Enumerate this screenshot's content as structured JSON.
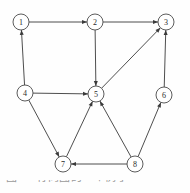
{
  "figure": {
    "caption": "图 一 有向图的一个例子",
    "background_color": "#fefefe",
    "node_fill_color": "#ffffff",
    "node_stroke_color": "#4a4a4a",
    "edge_color": "#3a3a3a",
    "label_color": "#2b2b2b",
    "width": 190,
    "height": 193
  },
  "chart_data": {
    "type": "diagram",
    "graph_type": "directed graph",
    "title": "",
    "node_radius": 8,
    "nodes": [
      {
        "id": "1",
        "label": "1",
        "x": 21,
        "y": 22
      },
      {
        "id": "2",
        "label": "2",
        "x": 95,
        "y": 22
      },
      {
        "id": "3",
        "label": "3",
        "x": 166,
        "y": 22
      },
      {
        "id": "4",
        "label": "4",
        "x": 25,
        "y": 93
      },
      {
        "id": "5",
        "label": "5",
        "x": 96,
        "y": 94
      },
      {
        "id": "6",
        "label": "6",
        "x": 164,
        "y": 95
      },
      {
        "id": "7",
        "label": "7",
        "x": 63,
        "y": 164
      },
      {
        "id": "8",
        "label": "8",
        "x": 135,
        "y": 164
      }
    ],
    "edges": [
      {
        "from": "1",
        "to": "2",
        "directed": true
      },
      {
        "from": "2",
        "to": "3",
        "directed": true
      },
      {
        "from": "4",
        "to": "1",
        "directed": true
      },
      {
        "from": "2",
        "to": "5",
        "directed": true
      },
      {
        "from": "4",
        "to": "5",
        "directed": true
      },
      {
        "from": "5",
        "to": "3",
        "directed": true
      },
      {
        "from": "6",
        "to": "3",
        "directed": true
      },
      {
        "from": "4",
        "to": "7",
        "directed": true
      },
      {
        "from": "7",
        "to": "5",
        "directed": true
      },
      {
        "from": "8",
        "to": "5",
        "directed": true
      },
      {
        "from": "8",
        "to": "6",
        "directed": true
      },
      {
        "from": "8",
        "to": "7",
        "directed": true
      }
    ]
  }
}
